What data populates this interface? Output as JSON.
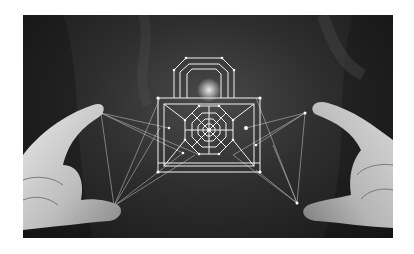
{
  "image": {
    "subject": "Two hands framing a glowing wireframe padlock made of connected nodes and lines",
    "style": "black-and-white photograph",
    "background_color": "#ffffff",
    "photo_tone": "#2e2e2e",
    "line_color": "#f2f2f2",
    "elements": [
      {
        "name": "padlock-wireframe",
        "description": "padlock outline with octagonal shackle and concentric octagon pattern on body"
      },
      {
        "name": "left-hand",
        "description": "left hand pinching wireframe between thumb and index finger"
      },
      {
        "name": "right-hand",
        "description": "right hand pinching wireframe between thumb and index finger"
      },
      {
        "name": "network-lines",
        "description": "thin lines connecting fingertips to lock nodes"
      }
    ]
  }
}
